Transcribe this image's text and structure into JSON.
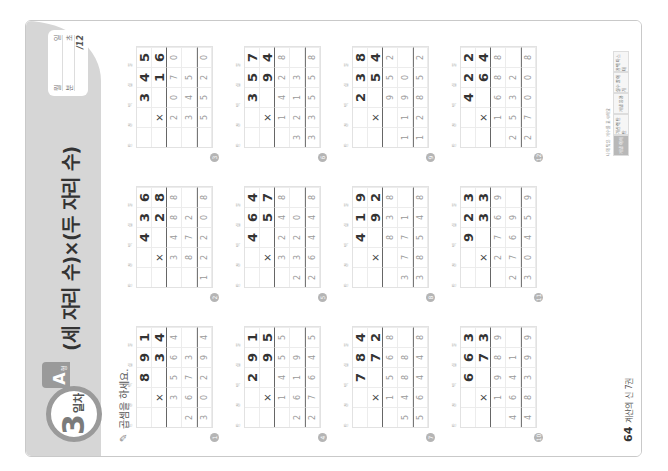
{
  "header": {
    "day_number": "3",
    "day_suffix": "일차",
    "type_letter": "A",
    "type_suffix": "형",
    "title": "(세 자리 수)×(두 자리 수)",
    "stamp": {
      "date_month": "월",
      "date_day": "일",
      "time_min": "분",
      "time_sec": "초",
      "score": "/12"
    }
  },
  "instruction": "곱셈을 하세요.",
  "place_labels": [
    "만",
    "천",
    "백",
    "십",
    "일"
  ],
  "operator": "×",
  "problems": [
    {
      "number": "1",
      "multiplicand": "891",
      "multiplier": "34",
      "partial1": "3564",
      "partial2": "2673",
      "total": "30294"
    },
    {
      "number": "2",
      "multiplicand": "436",
      "multiplier": "28",
      "partial1": "3488",
      "partial2": "872",
      "total": "12208"
    },
    {
      "number": "3",
      "multiplicand": "345",
      "multiplier": "16",
      "partial1": "2070",
      "partial2": "345",
      "total": "5520"
    },
    {
      "number": "4",
      "multiplicand": "291",
      "multiplier": "95",
      "partial1": "1455",
      "partial2": "2619",
      "total": "27645"
    },
    {
      "number": "5",
      "multiplicand": "464",
      "multiplier": "57",
      "partial1": "3248",
      "partial2": "2320",
      "total": "26448"
    },
    {
      "number": "6",
      "multiplicand": "357",
      "multiplier": "94",
      "partial1": "1428",
      "partial2": "3213",
      "total": "33558"
    },
    {
      "number": "7",
      "multiplicand": "784",
      "multiplier": "72",
      "partial1": "1568",
      "partial2": "5488",
      "total": "56448"
    },
    {
      "number": "8",
      "multiplicand": "419",
      "multiplier": "92",
      "partial1": "838",
      "partial2": "3771",
      "total": "38548"
    },
    {
      "number": "9",
      "multiplicand": "238",
      "multiplier": "54",
      "partial1": "952",
      "partial2": "1190",
      "total": "12852"
    },
    {
      "number": "10",
      "multiplicand": "663",
      "multiplier": "73",
      "partial1": "1989",
      "partial2": "4641",
      "total": "48399"
    },
    {
      "number": "11",
      "multiplicand": "923",
      "multiplier": "33",
      "partial1": "2769",
      "partial2": "2769",
      "total": "30459"
    },
    {
      "number": "12",
      "multiplicand": "422",
      "multiplier": "64",
      "partial1": "1688",
      "partial2": "2532",
      "total": "27008"
    }
  ],
  "footer": {
    "page_number": "64",
    "book_title": "계산의 신 7권"
  },
  "legend": {
    "caption": "나의 맞은 개수를 표시해요",
    "items": [
      "개념 이해",
      "계산력 탄탄",
      "개념 응용",
      "실수 줄이기",
      "완벽 마스터"
    ]
  }
}
